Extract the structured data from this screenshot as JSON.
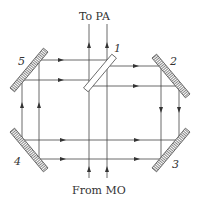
{
  "diagram": {
    "title_top": "To PA",
    "title_bottom": "From MO",
    "elements": [
      {
        "id": "1",
        "type": "beam-splitter"
      },
      {
        "id": "2",
        "type": "mirror"
      },
      {
        "id": "3",
        "type": "mirror"
      },
      {
        "id": "4",
        "type": "mirror"
      },
      {
        "id": "5",
        "type": "mirror"
      }
    ],
    "labels": {
      "m1": "1",
      "m2": "2",
      "m3": "3",
      "m4": "4",
      "m5": "5"
    },
    "colors": {
      "line": "#444444",
      "mirror_fill": "#dddddd"
    }
  }
}
